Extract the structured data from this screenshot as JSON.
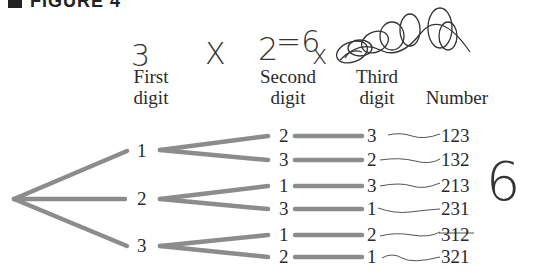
{
  "figure": {
    "label": "FIGURE 4"
  },
  "headers": {
    "first": [
      "First",
      "digit"
    ],
    "second": [
      "Second",
      "digit"
    ],
    "third": [
      "Third",
      "digit"
    ],
    "number": "Number"
  },
  "handwriting": {
    "first_count": "3",
    "times": "X",
    "second_count": "2",
    "equals_six": "=6",
    "crossed": "x",
    "total": "6"
  },
  "tree": {
    "first_digits": [
      "1",
      "2",
      "3"
    ],
    "rows": [
      {
        "second": "2",
        "third": "3",
        "number": "123",
        "struck": false
      },
      {
        "second": "3",
        "third": "2",
        "number": "132",
        "struck": false
      },
      {
        "second": "1",
        "third": "3",
        "number": "213",
        "struck": false
      },
      {
        "second": "3",
        "third": "1",
        "number": "231",
        "struck": false
      },
      {
        "second": "1",
        "third": "2",
        "number": "312",
        "struck": true
      },
      {
        "second": "2",
        "third": "1",
        "number": "321",
        "struck": false
      }
    ]
  },
  "colors": {
    "branch": "#8c8c8c",
    "ink": "#2a2a2a",
    "pencil": "#555555"
  }
}
